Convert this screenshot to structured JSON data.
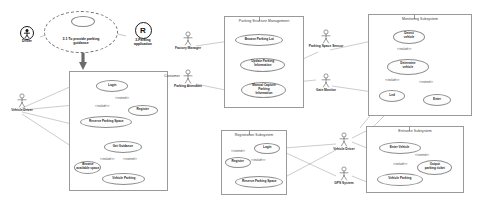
{
  "diagram": {
    "kind": "uml-use-case-diagram",
    "title_goal": "3.1 To provide parking\nguidance"
  },
  "goal_bubble": {
    "label": "3.1 To provide parking\nguidance"
  },
  "left_actors": {
    "driver": {
      "label": "Driver",
      "glyph": "person-in-circle"
    },
    "app": {
      "label": "3-Parking\napplication",
      "glyph": "R"
    }
  },
  "actors": [
    {
      "name": "actor-vehicle-driver-left",
      "label": "Vehicle Driver"
    },
    {
      "name": "actor-factory-manager",
      "label": "Factory Manager"
    },
    {
      "name": "actor-parking-attendant",
      "label": "Parking Attendant"
    },
    {
      "name": "actor-parking-space-sensor",
      "label": "Parking Space Sensor"
    },
    {
      "name": "actor-led-screen",
      "label": "LED Screen"
    },
    {
      "name": "actor-gate-monitor",
      "label": "Gate Monitor"
    },
    {
      "name": "actor-vehicle-driver-mid",
      "label": "Vehicle Driver"
    },
    {
      "name": "actor-gps-system",
      "label": "GPS System"
    }
  ],
  "systems": [
    {
      "id": "customer",
      "title": "Customer",
      "use_cases": [
        {
          "id": "uc-login",
          "label": "Login"
        },
        {
          "id": "uc-register",
          "label": "Register"
        },
        {
          "id": "uc-reserve-space",
          "label": "Reserve Parking Space"
        },
        {
          "id": "uc-get-guidance",
          "label": "Get Guidance"
        },
        {
          "id": "uc-browse-avail",
          "label": "Browse\navailable space"
        },
        {
          "id": "uc-vehicle-parking",
          "label": "Vehicle Parking"
        }
      ],
      "connectors": [
        {
          "label": "<<include>>"
        },
        {
          "label": "<<extend>>"
        },
        {
          "label": "<<include>>"
        },
        {
          "label": "<<extend>>"
        }
      ]
    },
    {
      "id": "parking-structure-management",
      "title": "Parking Structure Management",
      "use_cases": [
        {
          "id": "uc-browse-parking-lot",
          "label": "Browse Parking Lot"
        },
        {
          "id": "uc-update-parking-info",
          "label": "Update Parking\nInformation"
        },
        {
          "id": "uc-manual-capture",
          "label": "Manual Capture\nParking\nInformation"
        }
      ],
      "connectors": []
    },
    {
      "id": "registration-subsystem",
      "title": "Registration Subsystem",
      "use_cases": [
        {
          "id": "uc-reg-login",
          "label": "Login"
        },
        {
          "id": "uc-reg-register",
          "label": "Register"
        },
        {
          "id": "uc-reg-reserve",
          "label": "Reserve Parking Space"
        }
      ],
      "connectors": [
        {
          "label": "<<extend>>"
        },
        {
          "label": "<<include>>"
        }
      ]
    },
    {
      "id": "monitoring-subsystem",
      "title": "Monitoring Subsystem",
      "use_cases": [
        {
          "id": "uc-detect-vehicle",
          "label": "Detect\nvehicle"
        },
        {
          "id": "uc-determine-vehicle",
          "label": "Determine\nvehicle"
        },
        {
          "id": "uc-led",
          "label": "Led"
        },
        {
          "id": "uc-enter",
          "label": "Enter"
        }
      ],
      "connectors": [
        {
          "label": "<<include>>"
        },
        {
          "label": "<<include>>"
        },
        {
          "label": "<<extend>>"
        }
      ]
    },
    {
      "id": "entrance-subsystem",
      "title": "Entrance Subsystem",
      "use_cases": [
        {
          "id": "uc-enter-vehicle",
          "label": "Enter Vehicle"
        },
        {
          "id": "uc-output-ticket",
          "label": "Output\nparking ticket"
        },
        {
          "id": "uc-ent-vehicle-park",
          "label": "Vehicle Parking"
        }
      ],
      "connectors": [
        {
          "label": "<<extend>>"
        },
        {
          "label": "<<include>>"
        }
      ]
    }
  ],
  "colors": {
    "line": "#8d8d8d",
    "boundary": "#9a9a9a",
    "text": "#1f1f1f",
    "arrow": "#6b6b6b"
  }
}
